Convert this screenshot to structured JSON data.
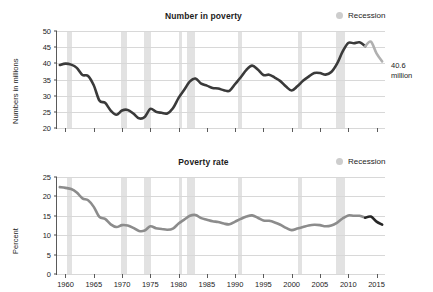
{
  "legend": {
    "recession_label": "Recession",
    "recession_color": "#e2e2e2",
    "swatch_name": "recession-swatch"
  },
  "panels": [
    {
      "id": "top",
      "title": "Number in poverty",
      "ylabel": "Numbers in millions",
      "annotation_line1": "40.6",
      "annotation_line2": "million",
      "line_color": "#3a3a3a",
      "tail_color": "#b0b0b0"
    },
    {
      "id": "bottom",
      "title": "Poverty rate",
      "ylabel": "Percent",
      "annotation_line1": "12.7",
      "annotation_line2": "percent",
      "line_color": "#8c8c8c",
      "tail_color": "#262626"
    }
  ],
  "chart_data": [
    {
      "type": "line",
      "title": "Number in poverty",
      "xlabel": "",
      "ylabel": "Numbers in millions",
      "units": "millions of people",
      "xlim": [
        1958.5,
        2016.5
      ],
      "ylim": [
        20,
        50
      ],
      "yticks": [
        20,
        25,
        30,
        35,
        40,
        45,
        50
      ],
      "xticks": [
        1960,
        1965,
        1970,
        1975,
        1980,
        1985,
        1990,
        1995,
        2000,
        2005,
        2010,
        2015
      ],
      "grid": true,
      "legend_position": "top-right",
      "line_color": "#3a3a3a",
      "tail_color": "#b0b0b0",
      "tail_start_year": 2013,
      "annotation": {
        "text": "40.6 million",
        "value": 40.6,
        "year": 2016
      },
      "recessions": [
        [
          1960.3,
          1961.1
        ],
        [
          1969.9,
          1970.9
        ],
        [
          1973.9,
          1975.2
        ],
        [
          1980.0,
          1980.6
        ],
        [
          1981.5,
          1982.9
        ],
        [
          1990.5,
          1991.2
        ],
        [
          2001.2,
          2001.9
        ],
        [
          2007.9,
          2009.5
        ]
      ],
      "x": [
        1959,
        1960,
        1961,
        1962,
        1963,
        1964,
        1965,
        1966,
        1967,
        1968,
        1969,
        1970,
        1971,
        1972,
        1973,
        1974,
        1975,
        1976,
        1977,
        1978,
        1979,
        1980,
        1981,
        1982,
        1983,
        1984,
        1985,
        1986,
        1987,
        1988,
        1989,
        1990,
        1991,
        1992,
        1993,
        1994,
        1995,
        1996,
        1997,
        1998,
        1999,
        2000,
        2001,
        2002,
        2003,
        2004,
        2005,
        2006,
        2007,
        2008,
        2009,
        2010,
        2011,
        2012,
        2013,
        2014,
        2015,
        2016
      ],
      "y": [
        39.5,
        39.9,
        39.6,
        38.6,
        36.4,
        36.1,
        33.2,
        28.5,
        27.8,
        25.4,
        24.1,
        25.4,
        25.6,
        24.5,
        23.0,
        23.4,
        25.9,
        25.0,
        24.7,
        24.5,
        26.1,
        29.3,
        31.8,
        34.4,
        35.3,
        33.7,
        33.1,
        32.4,
        32.2,
        31.7,
        31.5,
        33.6,
        35.7,
        38.0,
        39.3,
        38.1,
        36.4,
        36.5,
        35.6,
        34.5,
        32.8,
        31.6,
        32.9,
        34.6,
        35.9,
        37.0,
        37.0,
        36.5,
        37.3,
        39.8,
        43.6,
        46.3,
        46.2,
        46.5,
        45.3,
        46.7,
        43.1,
        40.6
      ]
    },
    {
      "type": "line",
      "title": "Poverty rate",
      "xlabel": "",
      "ylabel": "Percent",
      "units": "percent",
      "xlim": [
        1958.5,
        2016.5
      ],
      "ylim": [
        0,
        25
      ],
      "yticks": [
        0,
        5,
        10,
        15,
        20,
        25
      ],
      "xticks": [
        1960,
        1965,
        1970,
        1975,
        1980,
        1985,
        1990,
        1995,
        2000,
        2005,
        2010,
        2015
      ],
      "grid": true,
      "legend_position": "top-right",
      "line_color": "#8c8c8c",
      "tail_color": "#262626",
      "tail_start_year": 2013,
      "annotation": {
        "text": "12.7 percent",
        "value": 12.7,
        "year": 2016
      },
      "recessions": [
        [
          1960.3,
          1961.1
        ],
        [
          1969.9,
          1970.9
        ],
        [
          1973.9,
          1975.2
        ],
        [
          1980.0,
          1980.6
        ],
        [
          1981.5,
          1982.9
        ],
        [
          1990.5,
          1991.2
        ],
        [
          2001.2,
          2001.9
        ],
        [
          2007.9,
          2009.5
        ]
      ],
      "x": [
        1959,
        1960,
        1961,
        1962,
        1963,
        1964,
        1965,
        1966,
        1967,
        1968,
        1969,
        1970,
        1971,
        1972,
        1973,
        1974,
        1975,
        1976,
        1977,
        1978,
        1979,
        1980,
        1981,
        1982,
        1983,
        1984,
        1985,
        1986,
        1987,
        1988,
        1989,
        1990,
        1991,
        1992,
        1993,
        1994,
        1995,
        1996,
        1997,
        1998,
        1999,
        2000,
        2001,
        2002,
        2003,
        2004,
        2005,
        2006,
        2007,
        2008,
        2009,
        2010,
        2011,
        2012,
        2013,
        2014,
        2015,
        2016
      ],
      "y": [
        22.4,
        22.2,
        21.9,
        21.0,
        19.5,
        19.0,
        17.3,
        14.7,
        14.2,
        12.8,
        12.1,
        12.6,
        12.5,
        11.9,
        11.1,
        11.2,
        12.3,
        11.8,
        11.6,
        11.4,
        11.7,
        13.0,
        14.0,
        15.0,
        15.2,
        14.4,
        14.0,
        13.6,
        13.4,
        13.0,
        12.8,
        13.5,
        14.2,
        14.8,
        15.1,
        14.5,
        13.8,
        13.7,
        13.3,
        12.7,
        11.9,
        11.3,
        11.7,
        12.1,
        12.5,
        12.7,
        12.6,
        12.3,
        12.5,
        13.2,
        14.3,
        15.1,
        15.0,
        15.0,
        14.5,
        14.8,
        13.5,
        12.7
      ]
    }
  ]
}
